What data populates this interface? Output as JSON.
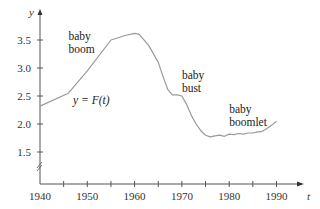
{
  "chart_data": {
    "type": "line",
    "title": "",
    "xlabel": "t",
    "ylabel": "y",
    "xlim": [
      1940,
      1995
    ],
    "ylim": [
      1.0,
      3.8
    ],
    "grid": false,
    "legend": null,
    "x_ticks": [
      "1940",
      "1950",
      "1960",
      "1970",
      "1980",
      "1990"
    ],
    "x_minor_ticks": [
      1945,
      1955,
      1965,
      1975,
      1985
    ],
    "y_ticks": [
      "1.5",
      "2.0",
      "2.5",
      "3.0",
      "3.5"
    ],
    "y_axis_break": true,
    "series": [
      {
        "name": "y = F(t)",
        "color": "#9a9a9a",
        "x": [
          1940,
          1946,
          1950,
          1955,
          1958,
          1960,
          1961,
          1963,
          1965,
          1966,
          1967,
          1968,
          1969,
          1970,
          1971,
          1972,
          1973,
          1974,
          1975,
          1976,
          1977,
          1978,
          1979,
          1980,
          1981,
          1982,
          1983,
          1984,
          1985,
          1986,
          1987,
          1988,
          1989,
          1990
        ],
        "values": [
          2.32,
          2.55,
          2.95,
          3.5,
          3.58,
          3.62,
          3.6,
          3.4,
          3.1,
          2.85,
          2.62,
          2.52,
          2.52,
          2.5,
          2.35,
          2.15,
          2.0,
          1.88,
          1.8,
          1.77,
          1.79,
          1.8,
          1.78,
          1.82,
          1.81,
          1.83,
          1.82,
          1.84,
          1.84,
          1.86,
          1.87,
          1.92,
          1.98,
          2.05
        ]
      }
    ],
    "annotations": [
      {
        "text": [
          "baby",
          "boom"
        ],
        "x": 1946,
        "y": 3.5
      },
      {
        "text": [
          "baby",
          "bust"
        ],
        "x": 1970,
        "y": 2.8
      },
      {
        "text": [
          "baby",
          "boomlet"
        ],
        "x": 1980,
        "y": 2.2
      },
      {
        "text": [
          "y = F(t)"
        ],
        "x": 1947,
        "y": 2.35,
        "italic": true
      }
    ]
  }
}
